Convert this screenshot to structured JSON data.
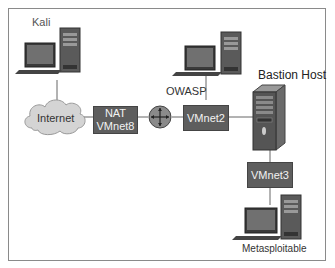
{
  "nodes": {
    "kali": {
      "label": "Kali",
      "type": "workstation"
    },
    "owasp": {
      "label": "OWASP",
      "type": "workstation"
    },
    "bastion": {
      "label": "Bastion Host",
      "type": "server"
    },
    "metasploitable": {
      "label": "Metasploitable",
      "type": "workstation"
    },
    "internet": {
      "label": "Internet",
      "type": "cloud"
    },
    "router": {
      "label": "",
      "type": "router"
    }
  },
  "networks": {
    "nat": {
      "line1": "NAT",
      "line2": "VMnet8"
    },
    "vmnet2": {
      "label": "VMnet2"
    },
    "vmnet3": {
      "label": "VMnet3"
    }
  },
  "colors": {
    "box_fill": "#5e5e5e",
    "box_text": "#f2f2f2",
    "cloud_fill": "#d4d4d4",
    "line": "#666666",
    "border": "#8a8a8a"
  }
}
